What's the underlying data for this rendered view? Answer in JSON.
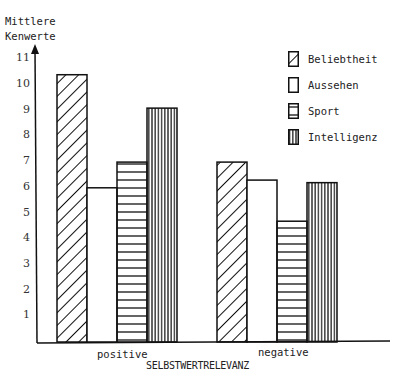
{
  "chart_data": {
    "type": "bar",
    "title": "",
    "ylabel": "Mittlere Kenwerte",
    "xlabel": "SELBSTWERTRELEVANZ",
    "ylim": [
      0,
      11
    ],
    "yticks": [
      1,
      2,
      3,
      4,
      5,
      6,
      7,
      8,
      9,
      10,
      11
    ],
    "categories": [
      "positive",
      "negative"
    ],
    "series": [
      {
        "name": "Beliebtheit",
        "pattern": "diagonal-hatch",
        "values": [
          10.4,
          7.0
        ]
      },
      {
        "name": "Aussehen",
        "pattern": "blank",
        "values": [
          6.0,
          6.3
        ]
      },
      {
        "name": "Sport",
        "pattern": "horizontal-lines",
        "values": [
          7.0,
          4.7
        ]
      },
      {
        "name": "Intelligenz",
        "pattern": "vertical-lines",
        "values": [
          9.1,
          6.2
        ]
      }
    ],
    "legend_position": "top-right",
    "grid": false
  },
  "labels": {
    "ytitle_line1": "Mittlere",
    "ytitle_line2": "Kenwerte",
    "xtitle": "SELBSTWERTRELEVANZ",
    "cat0": "positive",
    "cat1": "negative",
    "leg0": "Beliebtheit",
    "leg1": "Aussehen",
    "leg2": "Sport",
    "leg3": "Intelligenz"
  }
}
